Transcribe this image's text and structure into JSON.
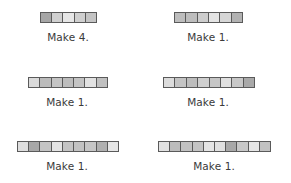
{
  "exercises": [
    {
      "label": "Make 4.",
      "bar": {
        "x": 40,
        "y": 12,
        "w": 57
      },
      "label_pos": {
        "cx": 68,
        "y": 31
      },
      "cells": [
        "#a6a6a6",
        "#d0d0d0",
        "#e6e6e6",
        "#cfcfcf",
        "#c4c4c4"
      ]
    },
    {
      "label": "Make 1.",
      "bar": {
        "x": 174,
        "y": 12,
        "w": 69
      },
      "label_pos": {
        "cx": 208,
        "y": 31
      },
      "cells": [
        "#bdbdbd",
        "#bdbdbd",
        "#cdcdcd",
        "#e4e4e4",
        "#d6d6d6",
        "#b2b2b2"
      ]
    },
    {
      "label": "Make 1.",
      "bar": {
        "x": 28,
        "y": 77,
        "w": 80
      },
      "label_pos": {
        "cx": 67,
        "y": 96
      },
      "cells": [
        "#dadada",
        "#bcbcbc",
        "#c4c4c4",
        "#bdbdbd",
        "#c4c4c4",
        "#e2e2e2",
        "#c0c0c0"
      ]
    },
    {
      "label": "Make 1.",
      "bar": {
        "x": 163,
        "y": 77,
        "w": 92
      },
      "label_pos": {
        "cx": 208,
        "y": 96
      },
      "cells": [
        "#dcdcdc",
        "#c4c4c4",
        "#bdbdbd",
        "#cfcfcf",
        "#c6c6c6",
        "#e0e0e0",
        "#c8c8c8",
        "#a9a9a9"
      ]
    },
    {
      "label": "Make 1.",
      "bar": {
        "x": 17,
        "y": 141,
        "w": 102
      },
      "label_pos": {
        "cx": 67,
        "y": 160
      },
      "cells": [
        "#dedede",
        "#a8a8a8",
        "#c4c4c4",
        "#e4e4e4",
        "#c4c4c4",
        "#c2c2c2",
        "#c6c6c6",
        "#b0b0b0",
        "#e6e6e6"
      ]
    },
    {
      "label": "Make 1.",
      "bar": {
        "x": 158,
        "y": 141,
        "w": 113
      },
      "label_pos": {
        "cx": 214,
        "y": 160
      },
      "cells": [
        "#e2e2e2",
        "#bcbcbc",
        "#c2c2c2",
        "#c4c4c4",
        "#e4e4e4",
        "#e0e0e0",
        "#a8a8a8",
        "#c8c8c8",
        "#e6e6e6",
        "#c2c2c2"
      ]
    }
  ]
}
